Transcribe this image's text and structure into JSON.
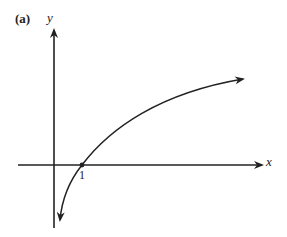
{
  "figure": {
    "panel_label": "(a)",
    "x_axis_label": "x",
    "y_axis_label": "y",
    "tick_labels": [
      "1"
    ],
    "marked_point": {
      "x": 1,
      "y": 0
    },
    "curve_description": "logarithmic curve y = log(x), passing through (1,0), approaching -infinity near y-axis and increasing slowly to the right",
    "line_color": "#222222"
  }
}
